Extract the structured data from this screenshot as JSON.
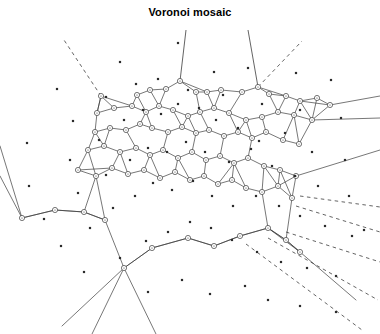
{
  "figure": {
    "title": "Voronoi mosaic",
    "background_color": "#ffffff",
    "stroke_color": "#3c3c3c",
    "seed_color": "#2b2b2b",
    "vertex_fill": "#ffffff"
  },
  "chart_data": {
    "type": "scatter",
    "title": "Voronoi mosaic",
    "xlabel": "",
    "ylabel": "",
    "grid": false,
    "legend": null,
    "xlim": [
      0,
      380
    ],
    "ylim": [
      0,
      334
    ],
    "counts": {
      "seeds": 78,
      "vertices": 86,
      "solid_edges": 122,
      "dashed_rays": 9
    },
    "seeds": [
      [
        57,
        89
      ],
      [
        120,
        62
      ],
      [
        178,
        43
      ],
      [
        214,
        72
      ],
      [
        248,
        68
      ],
      [
        296,
        73
      ],
      [
        331,
        80
      ],
      [
        27,
        143
      ],
      [
        73,
        121
      ],
      [
        106,
        97
      ],
      [
        136,
        84
      ],
      [
        158,
        79
      ],
      [
        188,
        90
      ],
      [
        223,
        95
      ],
      [
        262,
        104
      ],
      [
        300,
        110
      ],
      [
        341,
        118
      ],
      [
        29,
        186
      ],
      [
        70,
        160
      ],
      [
        99,
        140
      ],
      [
        124,
        120
      ],
      [
        143,
        110
      ],
      [
        161,
        114
      ],
      [
        178,
        104
      ],
      [
        199,
        108
      ],
      [
        216,
        120
      ],
      [
        238,
        128
      ],
      [
        259,
        141
      ],
      [
        285,
        133
      ],
      [
        312,
        152
      ],
      [
        345,
        160
      ],
      [
        44,
        219
      ],
      [
        78,
        193
      ],
      [
        106,
        175
      ],
      [
        130,
        160
      ],
      [
        148,
        148
      ],
      [
        167,
        152
      ],
      [
        186,
        142
      ],
      [
        205,
        152
      ],
      [
        229,
        162
      ],
      [
        251,
        149
      ],
      [
        272,
        166
      ],
      [
        295,
        176
      ],
      [
        318,
        186
      ],
      [
        349,
        196
      ],
      [
        61,
        246
      ],
      [
        90,
        228
      ],
      [
        113,
        208
      ],
      [
        135,
        196
      ],
      [
        153,
        183
      ],
      [
        172,
        190
      ],
      [
        193,
        181
      ],
      [
        212,
        196
      ],
      [
        233,
        206
      ],
      [
        256,
        196
      ],
      [
        279,
        206
      ],
      [
        300,
        216
      ],
      [
        325,
        226
      ],
      [
        352,
        236
      ],
      [
        84,
        272
      ],
      [
        120,
        258
      ],
      [
        146,
        241
      ],
      [
        168,
        232
      ],
      [
        190,
        222
      ],
      [
        211,
        228
      ],
      [
        232,
        240
      ],
      [
        257,
        252
      ],
      [
        281,
        262
      ],
      [
        307,
        268
      ],
      [
        336,
        276
      ],
      [
        148,
        292
      ],
      [
        182,
        280
      ],
      [
        210,
        294
      ],
      [
        245,
        286
      ],
      [
        268,
        300
      ],
      [
        300,
        306
      ],
      [
        336,
        312
      ],
      [
        364,
        230
      ]
    ],
    "vertices": [
      [
        101,
        96
      ],
      [
        137,
        95
      ],
      [
        150,
        90
      ],
      [
        166,
        89
      ],
      [
        180,
        81
      ],
      [
        196,
        92
      ],
      [
        207,
        92
      ],
      [
        221,
        90
      ],
      [
        242,
        92
      ],
      [
        258,
        87
      ],
      [
        269,
        94
      ],
      [
        286,
        96
      ],
      [
        300,
        101
      ],
      [
        317,
        98
      ],
      [
        330,
        105
      ],
      [
        97,
        113
      ],
      [
        114,
        108
      ],
      [
        132,
        106
      ],
      [
        146,
        112
      ],
      [
        159,
        106
      ],
      [
        173,
        110
      ],
      [
        188,
        116
      ],
      [
        200,
        112
      ],
      [
        214,
        108
      ],
      [
        229,
        113
      ],
      [
        246,
        120
      ],
      [
        262,
        117
      ],
      [
        278,
        112
      ],
      [
        294,
        115
      ],
      [
        312,
        120
      ],
      [
        95,
        132
      ],
      [
        110,
        128
      ],
      [
        126,
        130
      ],
      [
        140,
        124
      ],
      [
        152,
        128
      ],
      [
        168,
        132
      ],
      [
        182,
        127
      ],
      [
        196,
        133
      ],
      [
        209,
        130
      ],
      [
        224,
        136
      ],
      [
        238,
        132
      ],
      [
        252,
        138
      ],
      [
        266,
        132
      ],
      [
        283,
        140
      ],
      [
        299,
        144
      ],
      [
        88,
        150
      ],
      [
        104,
        146
      ],
      [
        120,
        152
      ],
      [
        136,
        148
      ],
      [
        150,
        155
      ],
      [
        163,
        150
      ],
      [
        178,
        158
      ],
      [
        192,
        152
      ],
      [
        206,
        160
      ],
      [
        220,
        156
      ],
      [
        234,
        163
      ],
      [
        248,
        158
      ],
      [
        264,
        166
      ],
      [
        280,
        170
      ],
      [
        296,
        176
      ],
      [
        78,
        170
      ],
      [
        96,
        176
      ],
      [
        112,
        168
      ],
      [
        128,
        174
      ],
      [
        144,
        170
      ],
      [
        160,
        178
      ],
      [
        175,
        172
      ],
      [
        190,
        180
      ],
      [
        204,
        176
      ],
      [
        218,
        184
      ],
      [
        232,
        180
      ],
      [
        246,
        188
      ],
      [
        262,
        192
      ],
      [
        278,
        186
      ],
      [
        292,
        198
      ],
      [
        22,
        218
      ],
      [
        55,
        210
      ],
      [
        84,
        212
      ],
      [
        105,
        220
      ],
      [
        124,
        268
      ],
      [
        152,
        248
      ],
      [
        188,
        238
      ],
      [
        214,
        246
      ],
      [
        240,
        236
      ],
      [
        268,
        228
      ],
      [
        286,
        240
      ],
      [
        300,
        252
      ]
    ],
    "rays": [
      {
        "from": [
          101,
          96
        ],
        "to": [
          64,
          40
        ],
        "style": "dashed"
      },
      {
        "from": [
          258,
          87
        ],
        "to": [
          302,
          41
        ],
        "style": "dashed"
      },
      {
        "from": [
          300,
          196
        ],
        "to": [
          380,
          207
        ],
        "style": "dashed"
      },
      {
        "from": [
          296,
          206
        ],
        "to": [
          380,
          232
        ],
        "style": "dashed"
      },
      {
        "from": [
          286,
          232
        ],
        "to": [
          380,
          262
        ],
        "style": "dashed"
      },
      {
        "from": [
          268,
          238
        ],
        "to": [
          378,
          300
        ],
        "style": "dashed"
      },
      {
        "from": [
          246,
          244
        ],
        "to": [
          362,
          330
        ],
        "style": "dashed"
      },
      {
        "from": [
          180,
          81
        ],
        "to": [
          186,
          30
        ],
        "style": "solid"
      },
      {
        "from": [
          258,
          87
        ],
        "to": [
          248,
          30
        ],
        "style": "solid"
      }
    ]
  }
}
